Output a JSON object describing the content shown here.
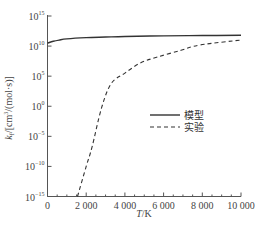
{
  "chart_data": {
    "type": "line",
    "title": "",
    "xlabel": "T/K",
    "ylabel": "k_f/[cm³/(mol·s)]",
    "xlim": [
      0,
      10000
    ],
    "ylim_log10": [
      -15,
      15
    ],
    "yscale": "log",
    "grid": false,
    "legend_position": "center-right",
    "x_ticks": [
      0,
      2000,
      4000,
      6000,
      8000,
      10000
    ],
    "x_tick_labels": [
      "0",
      "2 000",
      "4 000",
      "6 000",
      "8 000",
      "10 000"
    ],
    "y_ticks_log10": [
      15,
      10,
      5,
      0,
      -5,
      -10,
      -15
    ],
    "series": [
      {
        "name": "模型",
        "style": "solid",
        "x": [
          0,
          300,
          600,
          1000,
          2000,
          3000,
          4000,
          6000,
          8000,
          10000
        ],
        "log10_y": [
          10.5,
          10.8,
          11.0,
          11.2,
          11.4,
          11.5,
          11.6,
          11.7,
          11.75,
          11.8
        ]
      },
      {
        "name": "实验",
        "style": "dashed",
        "x": [
          1550,
          2000,
          2300,
          2800,
          3300,
          4000,
          4800,
          5700,
          6900,
          7900,
          10000
        ],
        "log10_y": [
          -15,
          -10,
          -6.8,
          -0.2,
          3.8,
          5.5,
          7.2,
          8.2,
          9.3,
          10.2,
          11.0
        ]
      }
    ]
  },
  "axes": {
    "x_title": "T/K",
    "y_title": "k_f/[cm³/(mol·s)]",
    "y_tick_labels": [
      {
        "base": "10",
        "exp": "15"
      },
      {
        "base": "10",
        "exp": "10"
      },
      {
        "base": "10",
        "exp": "5"
      },
      {
        "base": "10",
        "exp": "0"
      },
      {
        "base": "10",
        "exp": "−5"
      },
      {
        "base": "10",
        "exp": "−10"
      },
      {
        "base": "10",
        "exp": "−15"
      }
    ]
  },
  "legend": {
    "items": [
      {
        "label": "模型",
        "style": "solid"
      },
      {
        "label": "实验",
        "style": "dashed"
      }
    ]
  }
}
